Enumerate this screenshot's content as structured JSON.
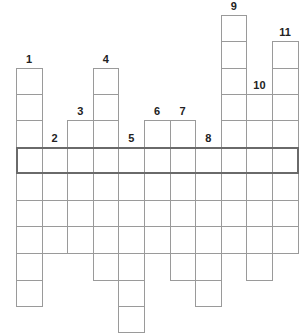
{
  "puzzle": {
    "type": "crossword",
    "grid_left": 16,
    "cell_width": 25.6,
    "row_lines": [
      15,
      41,
      68,
      94,
      120,
      147,
      173,
      200,
      226,
      253,
      280,
      306,
      332
    ],
    "highlight_row": 5,
    "columns": [
      {
        "number": "1",
        "start_row": 2,
        "end_row": 11
      },
      {
        "number": "2",
        "start_row": 5,
        "end_row": 9
      },
      {
        "number": "3",
        "start_row": 4,
        "end_row": 9
      },
      {
        "number": "4",
        "start_row": 2,
        "end_row": 10
      },
      {
        "number": "5",
        "start_row": 5,
        "end_row": 12
      },
      {
        "number": "6",
        "start_row": 4,
        "end_row": 9
      },
      {
        "number": "7",
        "start_row": 4,
        "end_row": 10
      },
      {
        "number": "8",
        "start_row": 5,
        "end_row": 11
      },
      {
        "number": "9",
        "start_row": 0,
        "end_row": 9
      },
      {
        "number": "10",
        "start_row": 3,
        "end_row": 10
      },
      {
        "number": "11",
        "start_row": 1,
        "end_row": 9
      }
    ],
    "colors": {
      "cell_border": "#9a9a9a",
      "highlight_border": "#6a6a6a",
      "number": "#222222",
      "background": "#ffffff"
    }
  }
}
